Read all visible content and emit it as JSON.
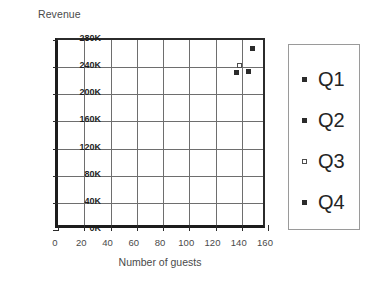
{
  "chart_data": {
    "type": "scatter",
    "title": "",
    "ylabel": "Revenue",
    "xlabel": "Number of guests",
    "xlim": [
      0,
      160
    ],
    "ylim": [
      0,
      280000
    ],
    "grid": true,
    "legend_position": "right",
    "x_ticks": [
      0,
      20,
      40,
      60,
      80,
      100,
      120,
      140,
      160
    ],
    "x_tick_labels": [
      "0",
      "20",
      "40",
      "60",
      "80",
      "100",
      "120",
      "140",
      "160"
    ],
    "y_ticks": [
      0,
      40000,
      80000,
      120000,
      160000,
      200000,
      240000,
      280000
    ],
    "y_tick_labels": [
      "0K",
      "40K",
      "80K",
      "120K",
      "160K",
      "200K",
      "240K",
      "280K"
    ],
    "series": [
      {
        "name": "Q1",
        "marker": "square-solid",
        "color": "#2b2b2b",
        "points": [
          {
            "x": 148,
            "y": 268000
          }
        ]
      },
      {
        "name": "Q2",
        "marker": "square-solid",
        "color": "#2b2b2b",
        "points": [
          {
            "x": 145,
            "y": 233000
          }
        ]
      },
      {
        "name": "Q3",
        "marker": "square-hollow",
        "color": "#4d4d4d",
        "points": [
          {
            "x": 138,
            "y": 242000
          }
        ]
      },
      {
        "name": "Q4",
        "marker": "square-solid",
        "color": "#2b2b2b",
        "points": [
          {
            "x": 136,
            "y": 232000
          }
        ]
      }
    ]
  },
  "legend": {
    "items": [
      {
        "label": "Q1",
        "marker": "square-solid"
      },
      {
        "label": "Q2",
        "marker": "square-solid"
      },
      {
        "label": "Q3",
        "marker": "square-hollow"
      },
      {
        "label": "Q4",
        "marker": "square-solid"
      }
    ]
  },
  "colors": {
    "axis": "#1c1c1c",
    "grid": "#6e6e6e",
    "marker": "#2b2b2b",
    "text": "#4a4a4a",
    "legend_border": "#9a9a9a"
  }
}
